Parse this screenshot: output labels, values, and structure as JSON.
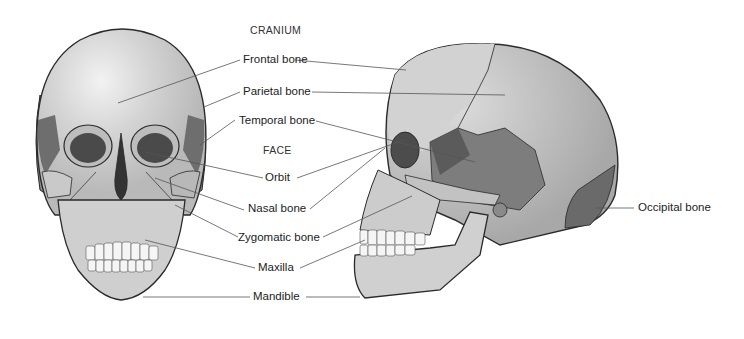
{
  "diagram": {
    "headings": {
      "cranium": "CRANIUM",
      "face": "FACE"
    },
    "labels": [
      {
        "id": "frontal",
        "text": "Frontal bone"
      },
      {
        "id": "parietal",
        "text": "Parietal bone"
      },
      {
        "id": "temporal",
        "text": "Temporal bone"
      },
      {
        "id": "orbit",
        "text": "Orbit"
      },
      {
        "id": "nasal",
        "text": "Nasal bone"
      },
      {
        "id": "zygomatic",
        "text": "Zygomatic bone"
      },
      {
        "id": "maxilla",
        "text": "Maxilla"
      },
      {
        "id": "mandible",
        "text": "Mandible"
      },
      {
        "id": "occipital",
        "text": "Occipital bone"
      }
    ],
    "views": [
      "anterior-skull",
      "lateral-skull"
    ],
    "colors": {
      "bone_light": "#d6d6d6",
      "bone_mid": "#b0b0b0",
      "bone_dark": "#7a7a7a",
      "bone_darker": "#5e5e5e",
      "outline": "#2a2a2a",
      "leader": "#555555"
    }
  }
}
